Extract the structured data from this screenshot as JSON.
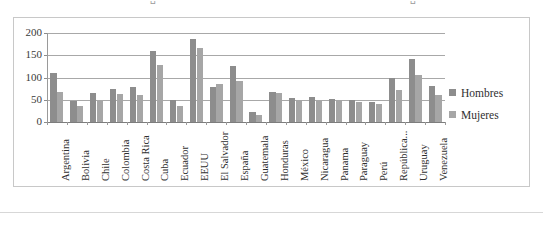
{
  "top_cutoff": {
    "fragment_1": "␣",
    "fragment_2": "·",
    "fragment_3": "␣"
  },
  "legend": {
    "position": "right",
    "items": [
      {
        "label": "Hombres",
        "color": "#8d8d8d",
        "marker": "square-marker"
      },
      {
        "label": "Mujeres",
        "color": "#a6a6a6",
        "marker": "square-marker"
      }
    ]
  },
  "axis": {
    "y_ticks": [
      "0",
      "50",
      "100",
      "150",
      "200"
    ],
    "y_min": 0,
    "y_max": 200,
    "y_step": 50
  },
  "chart_data": {
    "type": "bar",
    "title": "",
    "subtitle": "",
    "xlabel": "",
    "ylabel": "",
    "ylim": [
      0,
      200
    ],
    "y_ticks": [
      0,
      50,
      100,
      150,
      200
    ],
    "grid": true,
    "legend_position": "right",
    "categories": [
      "Argentina",
      "Bolivia",
      "Chile",
      "Colombia",
      "Costa Rica",
      "Cuba",
      "Ecuador",
      "EEUU",
      "El Salvador",
      "España",
      "Guatemala",
      "Honduras",
      "México",
      "Nicaragua",
      "Panama",
      "Paraguay",
      "Perú",
      "República...",
      "Uruguay",
      "Venezuela"
    ],
    "series": [
      {
        "name": "Hombres",
        "color": "#8d8d8d",
        "values": [
          110,
          48,
          65,
          75,
          79,
          159,
          50,
          186,
          78,
          126,
          22,
          68,
          53,
          57,
          51,
          49,
          44,
          100,
          141,
          82
        ]
      },
      {
        "name": "Mujeres",
        "color": "#a6a6a6",
        "values": [
          67,
          37,
          47,
          63,
          60,
          129,
          36,
          167,
          86,
          93,
          16,
          66,
          50,
          47,
          50,
          45,
          40,
          73,
          105,
          61
        ]
      }
    ]
  }
}
